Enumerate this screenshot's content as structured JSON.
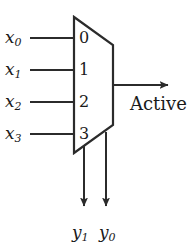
{
  "figure": {
    "type": "logic-diagram",
    "component": "priority-encoder",
    "background_color": "#ffffff",
    "line_color": "#2b2b2b",
    "text_color": "#1a1a1a"
  },
  "inputs": [
    {
      "label": "x",
      "sub": "0",
      "port": "0",
      "line_y": 38
    },
    {
      "label": "x",
      "sub": "1",
      "port": "1",
      "line_y": 70
    },
    {
      "label": "x",
      "sub": "2",
      "port": "2",
      "line_y": 102
    },
    {
      "label": "x",
      "sub": "3",
      "port": "3",
      "line_y": 134
    }
  ],
  "ports": {
    "p0": "0",
    "p1": "1",
    "p2": "2",
    "p3": "3"
  },
  "outputs": {
    "active": {
      "label": "Active",
      "arrow_y": 85
    },
    "y1": {
      "label": "y",
      "sub": "1",
      "arrow_x": 84
    },
    "y0": {
      "label": "y",
      "sub": "0",
      "arrow_x": 106
    }
  },
  "body": {
    "shape": "trapezoid",
    "top_left": [
      74,
      17
    ],
    "top_right": [
      113,
      45
    ],
    "bottom_right": [
      113,
      125
    ],
    "bottom_left": [
      74,
      153
    ]
  }
}
